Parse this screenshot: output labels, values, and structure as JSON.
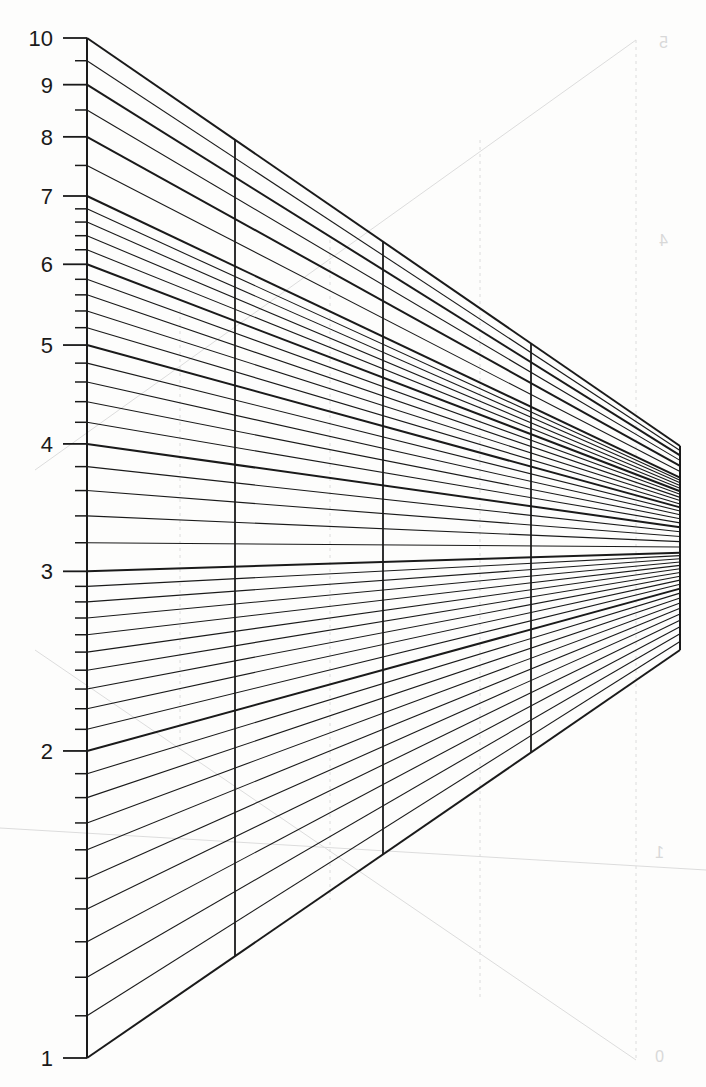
{
  "diagram": {
    "type": "perspective log-scale grid",
    "scale": "log10, one decade (1 to 10)",
    "axis_labels": [
      "1",
      "2",
      "3",
      "4",
      "5",
      "6",
      "7",
      "8",
      "9",
      "10"
    ],
    "major_values": [
      1,
      2,
      3,
      4,
      5,
      6,
      7,
      8,
      9,
      10
    ],
    "minor_values": [
      1.1,
      1.2,
      1.3,
      1.4,
      1.5,
      1.6,
      1.7,
      1.8,
      1.9,
      2.1,
      2.2,
      2.3,
      2.4,
      2.5,
      2.6,
      2.7,
      2.8,
      2.9,
      3.2,
      3.4,
      3.6,
      3.8,
      4.2,
      4.4,
      4.6,
      4.8,
      5.2,
      5.4,
      5.6,
      5.8,
      6.2,
      6.4,
      6.6,
      6.8,
      7.5,
      8.5,
      9.5
    ],
    "geometry": {
      "left_edge_x": 87,
      "left_y_at_1": 1058,
      "left_y_at_10": 38,
      "right_edge_x": 680,
      "right_y_at_1": 650,
      "right_y_at_10": 446,
      "vertical_dividers_x": [
        235,
        383,
        531
      ],
      "major_tick_len": 24,
      "minor_tick_len": 12
    },
    "colors": {
      "ink": "#1a1a1a",
      "paper": "#fdfdfc",
      "bleed_through": "#dcdcdc"
    },
    "bleed_through_labels": [
      {
        "text": "5",
        "x": 668,
        "y": 48
      },
      {
        "text": "4",
        "x": 668,
        "y": 246
      },
      {
        "text": "1",
        "x": 664,
        "y": 858
      },
      {
        "text": "0",
        "x": 664,
        "y": 1062
      }
    ]
  }
}
